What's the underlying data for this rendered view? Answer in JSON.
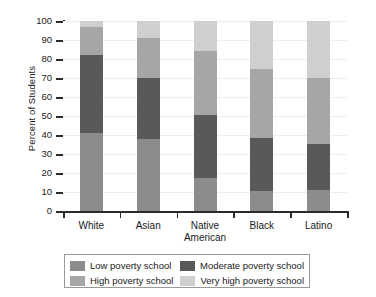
{
  "chart_data": {
    "type": "bar",
    "subtype": "stacked-percent",
    "title": "",
    "xlabel": "",
    "ylabel": "Percent of Students",
    "ylim": [
      0,
      100
    ],
    "ytick_step": 10,
    "yticks": [
      0,
      10,
      20,
      30,
      40,
      50,
      60,
      70,
      80,
      90,
      100
    ],
    "ytick_labels": [
      "0",
      "10",
      "20",
      "30",
      "40",
      "50",
      "60",
      "70",
      "80",
      "90",
      "100"
    ],
    "grid": true,
    "grid_axis": "y",
    "legend_position": "below",
    "categories": [
      "White",
      "Asian",
      "Native American",
      "Black",
      "Latino"
    ],
    "category_labels_multiline": [
      [
        "White"
      ],
      [
        "Asian"
      ],
      [
        "Native",
        "American"
      ],
      [
        "Black"
      ],
      [
        "Latino"
      ]
    ],
    "series": [
      {
        "name": "Low poverty school",
        "color": "#8c8c8c",
        "values": [
          41,
          38,
          17.5,
          10.5,
          11
        ]
      },
      {
        "name": "Moderate poverty school",
        "color": "#595959",
        "values": [
          41,
          32,
          33,
          28,
          24.5
        ]
      },
      {
        "name": "High poverty school",
        "color": "#a6a6a6",
        "values": [
          15,
          21,
          33.5,
          36.5,
          34.5
        ]
      },
      {
        "name": "Very high poverty school",
        "color": "#cfcfcf",
        "values": [
          3,
          9,
          16,
          25,
          30
        ]
      }
    ],
    "cumulative_tops": {
      "White": [
        41,
        82,
        97,
        100
      ],
      "Asian": [
        38,
        70,
        91,
        100
      ],
      "Native American": [
        17.5,
        50.5,
        84,
        100
      ],
      "Black": [
        10.5,
        38.5,
        75,
        100
      ],
      "Latino": [
        11,
        35.5,
        70,
        100
      ]
    }
  },
  "legend": {
    "entries": [
      {
        "label": "Low poverty school",
        "color": "#8c8c8c"
      },
      {
        "label": "Moderate poverty school",
        "color": "#595959"
      },
      {
        "label": "High poverty school",
        "color": "#a6a6a6"
      },
      {
        "label": "Very high poverty school",
        "color": "#cfcfcf"
      }
    ]
  },
  "axes": {
    "y_title": "Percent of Students",
    "x_title": ""
  },
  "colors": {
    "axis": "#2b2b2b",
    "grid": "#eceef0",
    "text": "#1a1a1a",
    "background": "#ffffff",
    "legend_border": "#9a9a9a"
  }
}
